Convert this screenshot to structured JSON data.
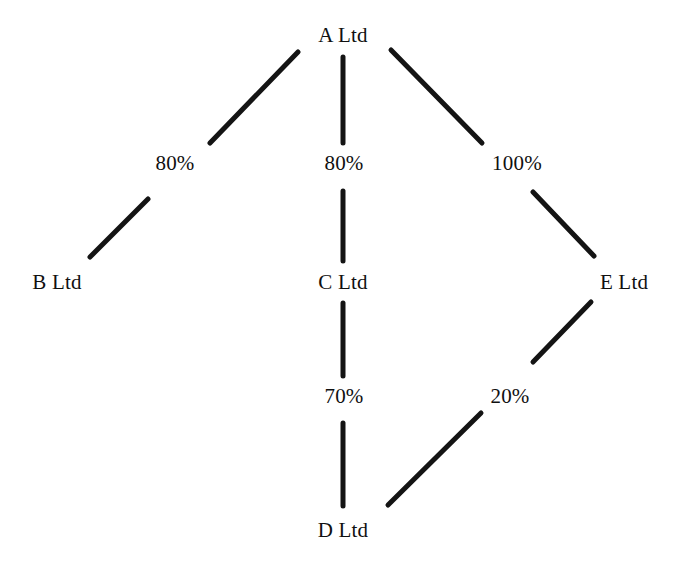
{
  "diagram": {
    "type": "ownership-structure-tree",
    "title": "",
    "background_color": "#ffffff",
    "line_color": "#141414",
    "text_color": "#101010",
    "nodes": [
      {
        "id": "A",
        "label": "A Ltd",
        "x": 343,
        "y": 35
      },
      {
        "id": "B",
        "label": "B Ltd",
        "x": 57,
        "y": 282
      },
      {
        "id": "C",
        "label": "C Ltd",
        "x": 343,
        "y": 282
      },
      {
        "id": "E",
        "label": "E Ltd",
        "x": 624,
        "y": 282
      },
      {
        "id": "D",
        "label": "D Ltd",
        "x": 343,
        "y": 530
      }
    ],
    "edges": [
      {
        "id": "A-B",
        "from": "A",
        "to": "B",
        "label": "80%",
        "label_x": 175,
        "label_y": 163,
        "seg1": {
          "x1": 298,
          "y1": 52,
          "x2": 210,
          "y2": 143
        },
        "seg2": {
          "x1": 148,
          "y1": 199,
          "x2": 90,
          "y2": 257
        }
      },
      {
        "id": "A-C",
        "from": "A",
        "to": "C",
        "label": "80%",
        "label_x": 344,
        "label_y": 163,
        "seg1": {
          "x1": 343,
          "y1": 57,
          "x2": 343,
          "y2": 143
        },
        "seg2": {
          "x1": 343,
          "y1": 191,
          "x2": 343,
          "y2": 261
        }
      },
      {
        "id": "A-E",
        "from": "A",
        "to": "E",
        "label": "100%",
        "label_x": 517,
        "label_y": 163,
        "seg1": {
          "x1": 391,
          "y1": 50,
          "x2": 482,
          "y2": 143
        },
        "seg2": {
          "x1": 533,
          "y1": 192,
          "x2": 594,
          "y2": 256
        }
      },
      {
        "id": "C-D",
        "from": "C",
        "to": "D",
        "label": "70%",
        "label_x": 344,
        "label_y": 396,
        "seg1": {
          "x1": 343,
          "y1": 303,
          "x2": 343,
          "y2": 376
        },
        "seg2": {
          "x1": 343,
          "y1": 423,
          "x2": 343,
          "y2": 506
        }
      },
      {
        "id": "E-D",
        "from": "E",
        "to": "D",
        "label": "20%",
        "label_x": 510,
        "label_y": 396,
        "seg1": {
          "x1": 591,
          "y1": 302,
          "x2": 533,
          "y2": 362
        },
        "seg2": {
          "x1": 481,
          "y1": 413,
          "x2": 388,
          "y2": 505
        }
      }
    ]
  }
}
